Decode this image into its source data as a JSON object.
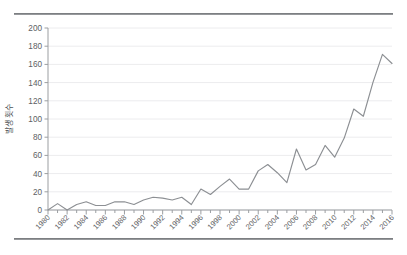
{
  "figure": {
    "top_rule": "horizontal-rule",
    "bottom_rule": "horizontal-rule"
  },
  "chart_data": {
    "type": "line",
    "title": "",
    "subtitle": "",
    "xlabel": "",
    "ylabel": "발생 횟수",
    "xlim": [
      1980,
      2016
    ],
    "ylim": [
      0,
      200
    ],
    "ytick_step": 20,
    "xtick_step": 2,
    "minor_xticks": 1,
    "grid": true,
    "grid_axis": "y",
    "legend": false,
    "legend_position": "none",
    "line_color": "#8c8f93",
    "grid_color": "#ececee",
    "axis_color": "#9b9ea1",
    "yticks": [
      0,
      20,
      40,
      60,
      80,
      100,
      120,
      140,
      160,
      180,
      200
    ],
    "xticks": [
      1980,
      1982,
      1984,
      1986,
      1988,
      1990,
      1992,
      1994,
      1996,
      1998,
      2000,
      2002,
      2004,
      2006,
      2008,
      2010,
      2012,
      2014,
      2016
    ],
    "x": [
      1980,
      1981,
      1982,
      1983,
      1984,
      1985,
      1986,
      1987,
      1988,
      1989,
      1990,
      1991,
      1992,
      1993,
      1994,
      1995,
      1996,
      1997,
      1998,
      1999,
      2000,
      2001,
      2002,
      2003,
      2004,
      2005,
      2006,
      2007,
      2008,
      2009,
      2010,
      2011,
      2012,
      2013,
      2014,
      2015,
      2016
    ],
    "values": [
      0,
      7,
      0,
      6,
      9,
      5,
      5,
      9,
      9,
      6,
      11,
      14,
      13,
      11,
      14,
      6,
      23,
      17,
      26,
      34,
      23,
      23,
      43,
      50,
      41,
      30,
      67,
      44,
      50,
      71,
      58,
      79,
      111,
      103,
      140,
      171,
      161
    ],
    "series": [
      {
        "name": "발생 횟수",
        "values": [
          0,
          7,
          0,
          6,
          9,
          5,
          5,
          9,
          9,
          6,
          11,
          14,
          13,
          11,
          14,
          6,
          23,
          17,
          26,
          34,
          23,
          23,
          43,
          50,
          41,
          30,
          67,
          44,
          50,
          71,
          58,
          79,
          111,
          103,
          140,
          171,
          161
        ]
      }
    ]
  }
}
